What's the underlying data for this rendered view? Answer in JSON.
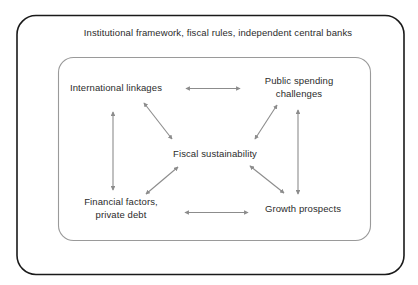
{
  "diagram": {
    "title": "Institutional framework, fiscal rules, independent central banks",
    "outer_box_name": "outer-frame",
    "inner_box_name": "inner-frame",
    "colors": {
      "outer_border": "#1a1a1a",
      "inner_border": "#9a9a9a",
      "arrow": "#8c8c8c",
      "text": "#2b2b2b",
      "background": "#ffffff"
    },
    "nodes": [
      {
        "id": "international-linkages",
        "label": "International linkages"
      },
      {
        "id": "public-spending-challenges",
        "label": "Public spending\nchallenges"
      },
      {
        "id": "fiscal-sustainability",
        "label": "Fiscal sustainability"
      },
      {
        "id": "financial-factors",
        "label": "Financial factors,\nprivate debt"
      },
      {
        "id": "growth-prospects",
        "label": "Growth prospects"
      }
    ],
    "connections": [
      {
        "id": "international-to-public",
        "from": "international-linkages",
        "to": "public-spending-challenges",
        "style": "double-headed"
      },
      {
        "id": "international-to-financial",
        "from": "international-linkages",
        "to": "financial-factors",
        "style": "double-headed"
      },
      {
        "id": "international-to-fiscal",
        "from": "international-linkages",
        "to": "fiscal-sustainability",
        "style": "double-headed"
      },
      {
        "id": "public-to-fiscal",
        "from": "public-spending-challenges",
        "to": "fiscal-sustainability",
        "style": "double-headed"
      },
      {
        "id": "public-to-growth",
        "from": "public-spending-challenges",
        "to": "growth-prospects",
        "style": "double-headed"
      },
      {
        "id": "financial-to-fiscal",
        "from": "financial-factors",
        "to": "fiscal-sustainability",
        "style": "double-headed"
      },
      {
        "id": "fiscal-to-growth",
        "from": "fiscal-sustainability",
        "to": "growth-prospects",
        "style": "double-headed"
      },
      {
        "id": "financial-to-growth",
        "from": "financial-factors",
        "to": "growth-prospects",
        "style": "double-headed"
      }
    ]
  }
}
